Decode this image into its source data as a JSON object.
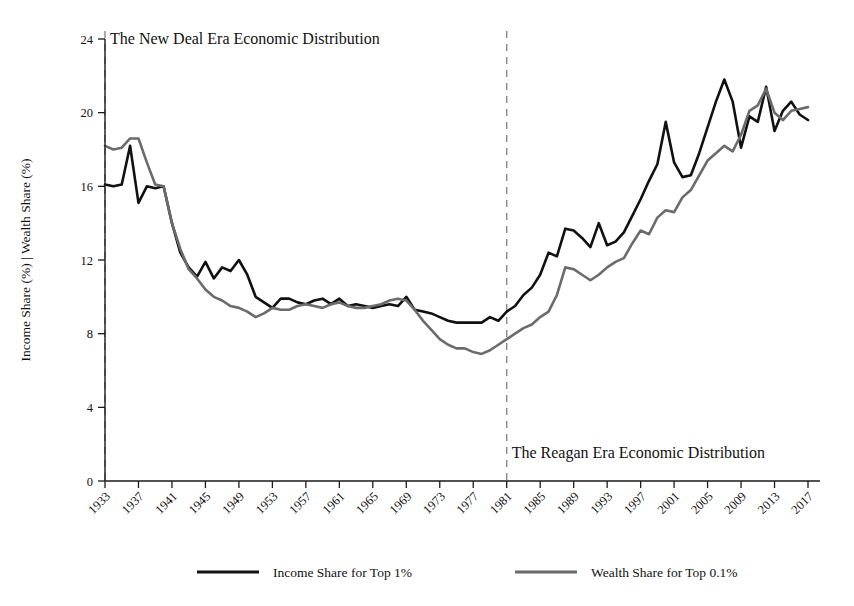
{
  "chart_data": {
    "type": "line",
    "title": "",
    "xlabel": "",
    "ylabel": "Income Share (%) | Wealth Share (%)",
    "xlim": [
      1932,
      2018
    ],
    "ylim": [
      0,
      25
    ],
    "yticks": [
      0,
      4,
      8,
      12,
      16,
      20,
      24
    ],
    "xticks": [
      1933,
      1937,
      1941,
      1945,
      1949,
      1953,
      1957,
      1961,
      1965,
      1969,
      1973,
      1977,
      1981,
      1985,
      1989,
      1993,
      1997,
      2001,
      2005,
      2009,
      2013,
      2017
    ],
    "grid": false,
    "legend_position": "bottom",
    "x": [
      1933,
      1934,
      1935,
      1936,
      1937,
      1938,
      1939,
      1940,
      1941,
      1942,
      1943,
      1944,
      1945,
      1946,
      1947,
      1948,
      1949,
      1950,
      1951,
      1952,
      1953,
      1954,
      1955,
      1956,
      1957,
      1958,
      1959,
      1960,
      1961,
      1962,
      1963,
      1964,
      1965,
      1966,
      1967,
      1968,
      1969,
      1970,
      1971,
      1972,
      1973,
      1974,
      1975,
      1976,
      1977,
      1978,
      1979,
      1980,
      1981,
      1982,
      1983,
      1984,
      1985,
      1986,
      1987,
      1988,
      1989,
      1990,
      1991,
      1992,
      1993,
      1994,
      1995,
      1996,
      1997,
      1998,
      1999,
      2000,
      2001,
      2002,
      2003,
      2004,
      2005,
      2006,
      2007,
      2008,
      2009,
      2010,
      2011,
      2012,
      2013,
      2014,
      2015,
      2016,
      2017
    ],
    "series": [
      {
        "name": "Income Share for Top 1%",
        "color": "#111111",
        "values": [
          16.1,
          16.0,
          16.1,
          18.2,
          15.1,
          16.0,
          15.9,
          16.0,
          14.0,
          12.4,
          11.6,
          11.1,
          11.9,
          11.0,
          11.6,
          11.4,
          12.0,
          11.2,
          10.0,
          9.7,
          9.4,
          9.9,
          9.9,
          9.7,
          9.6,
          9.8,
          9.9,
          9.6,
          9.9,
          9.5,
          9.6,
          9.5,
          9.4,
          9.5,
          9.6,
          9.5,
          10.0,
          9.3,
          9.2,
          9.1,
          8.9,
          8.7,
          8.6,
          8.6,
          8.6,
          8.6,
          8.9,
          8.7,
          9.2,
          9.5,
          10.1,
          10.5,
          11.2,
          12.4,
          12.2,
          13.7,
          13.6,
          13.2,
          12.7,
          14.0,
          12.8,
          13.0,
          13.5,
          14.4,
          15.3,
          16.3,
          17.2,
          19.5,
          17.3,
          16.5,
          16.6,
          17.8,
          19.2,
          20.6,
          21.8,
          20.6,
          18.1,
          19.8,
          19.5,
          21.4,
          19.0,
          20.1,
          20.6,
          19.9,
          19.6
        ]
      },
      {
        "name": "Wealth Share for Top 0.1%",
        "color": "#6b6b6b",
        "values": [
          18.2,
          18.0,
          18.1,
          18.6,
          18.6,
          17.3,
          16.1,
          16.0,
          14.0,
          12.6,
          11.5,
          11.0,
          10.4,
          10.0,
          9.8,
          9.5,
          9.4,
          9.2,
          8.9,
          9.1,
          9.4,
          9.3,
          9.3,
          9.5,
          9.6,
          9.5,
          9.4,
          9.6,
          9.7,
          9.5,
          9.4,
          9.4,
          9.5,
          9.6,
          9.8,
          9.9,
          9.8,
          9.3,
          8.7,
          8.2,
          7.7,
          7.4,
          7.2,
          7.2,
          7.0,
          6.9,
          7.1,
          7.4,
          7.7,
          8.0,
          8.3,
          8.5,
          8.9,
          9.2,
          10.1,
          11.6,
          11.5,
          11.2,
          10.9,
          11.2,
          11.6,
          11.9,
          12.1,
          12.9,
          13.6,
          13.4,
          14.3,
          14.7,
          14.6,
          15.4,
          15.8,
          16.6,
          17.4,
          17.8,
          18.2,
          17.9,
          18.8,
          20.1,
          20.4,
          21.3,
          20.0,
          19.6,
          20.1,
          20.2,
          20.3
        ]
      }
    ],
    "annotations": [
      {
        "text": "The New Deal Era Economic Distribution",
        "x": 1933,
        "y": 24.0,
        "align": "left"
      },
      {
        "text": "The Reagan Era Economic Distribution",
        "x": 1981,
        "y": 1.5,
        "align": "left"
      }
    ],
    "vlines": [
      {
        "x": 1933,
        "style": "dashed",
        "color": "#8a8a8a"
      },
      {
        "x": 1981,
        "style": "dashed",
        "color": "#8a8a8a"
      }
    ]
  },
  "legend": {
    "items": [
      {
        "label": "Income Share for Top 1%",
        "color": "#111111"
      },
      {
        "label": "Wealth Share for Top 0.1%",
        "color": "#6b6b6b"
      }
    ]
  },
  "axis": {
    "y_title": "Income Share (%) | Wealth Share (%)",
    "y_ticklabels": [
      "0",
      "4",
      "8",
      "12",
      "16",
      "20",
      "24"
    ],
    "x_ticklabels": [
      "1933",
      "1937",
      "1941",
      "1945",
      "1949",
      "1953",
      "1957",
      "1961",
      "1965",
      "1969",
      "1973",
      "1977",
      "1981",
      "1985",
      "1989",
      "1993",
      "1997",
      "2001",
      "2005",
      "2009",
      "2013",
      "2017"
    ]
  }
}
